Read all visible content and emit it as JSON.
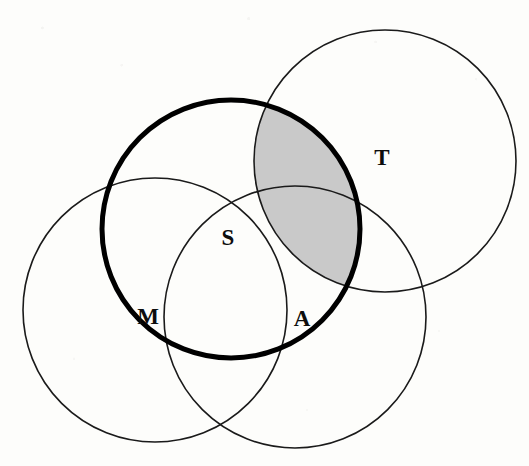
{
  "figure": {
    "kind": "venn-diagram",
    "background_color": "#fdfdfb",
    "width": 529,
    "height": 466,
    "thin_stroke_color": "#1a1a1a",
    "thin_stroke_width": 1.6,
    "thick_stroke_color": "#000000",
    "thick_stroke_width": 5,
    "shaded_fill_color": "#c9c9c9"
  },
  "sets": [
    {
      "id": "M",
      "label": "M",
      "label_x": 148,
      "label_y": 316,
      "cx": 155,
      "cy": 310,
      "r": 132,
      "emphasis": "thin"
    },
    {
      "id": "S",
      "label": "S",
      "label_x": 228,
      "label_y": 237,
      "cx": 231,
      "cy": 229,
      "r": 129,
      "emphasis": "thick"
    },
    {
      "id": "A",
      "label": "A",
      "label_x": 302,
      "label_y": 318,
      "cx": 295,
      "cy": 317,
      "r": 131,
      "emphasis": "thin"
    },
    {
      "id": "T",
      "label": "T",
      "label_x": 382,
      "label_y": 157,
      "cx": 385,
      "cy": 161,
      "r": 131,
      "emphasis": "thin"
    }
  ],
  "shaded_region": {
    "name": "intersection-bold-and-T",
    "members": [
      "S",
      "T"
    ],
    "fill": "#c9c9c9"
  }
}
